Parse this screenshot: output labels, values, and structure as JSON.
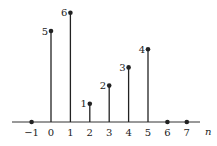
{
  "chart_data": {
    "type": "stem",
    "title": "",
    "xlabel": "n",
    "ylabel": "",
    "x": [
      -1,
      0,
      1,
      2,
      3,
      4,
      5,
      6,
      7
    ],
    "values": [
      0,
      5,
      6,
      1,
      2,
      3,
      4,
      0,
      0
    ],
    "data_labels": [
      "",
      "5",
      "6",
      "1",
      "2",
      "3",
      "4",
      "",
      ""
    ],
    "tick_labels": [
      "−1",
      "0",
      "1",
      "2",
      "3",
      "4",
      "5",
      "6",
      "7"
    ],
    "ylim": [
      0,
      6
    ],
    "grid": false,
    "legend": null,
    "colors": {
      "stem": "#222222",
      "axis": "#333333"
    }
  }
}
